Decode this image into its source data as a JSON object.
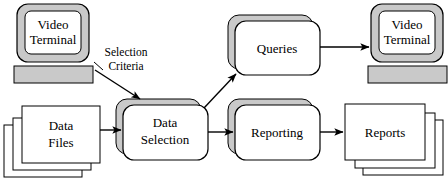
{
  "diagram": {
    "colors": {
      "shape_fill": "#ffffff",
      "shadow_fill": "#c9c9c9",
      "stroke": "#000000",
      "background": "#ffffff"
    },
    "nodes": {
      "video_terminal_input": {
        "type": "video-terminal",
        "label_line1": "Video",
        "label_line2": "Terminal"
      },
      "data_files": {
        "type": "multi-document-stack",
        "label_line1": "Data",
        "label_line2": "Files"
      },
      "data_selection": {
        "type": "process",
        "label_line1": "Data",
        "label_line2": "Selection"
      },
      "queries": {
        "type": "process",
        "label_line1": "Queries",
        "label_line2": ""
      },
      "reporting": {
        "type": "process",
        "label_line1": "Reporting",
        "label_line2": ""
      },
      "reports": {
        "type": "multi-document-stack",
        "label_line1": "Reports",
        "label_line2": ""
      },
      "video_terminal_output": {
        "type": "video-terminal",
        "label_line1": "Video",
        "label_line2": "Terminal"
      }
    },
    "edges": {
      "terminal_to_selection": {
        "label_line1": "Selection",
        "label_line2": "Criteria"
      },
      "files_to_selection": {
        "label_line1": "",
        "label_line2": ""
      },
      "selection_to_queries": {
        "label_line1": "",
        "label_line2": ""
      },
      "selection_to_reporting": {
        "label_line1": "",
        "label_line2": ""
      },
      "queries_to_terminal": {
        "label_line1": "",
        "label_line2": ""
      },
      "reporting_to_reports": {
        "label_line1": "",
        "label_line2": ""
      }
    }
  }
}
